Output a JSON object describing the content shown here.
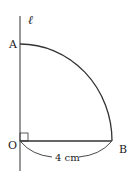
{
  "diagram": {
    "line_label": "ℓ",
    "points": {
      "A": "A",
      "O": "O",
      "B": "B"
    },
    "radius_label": "4 cm",
    "right_angle_at": "O"
  }
}
